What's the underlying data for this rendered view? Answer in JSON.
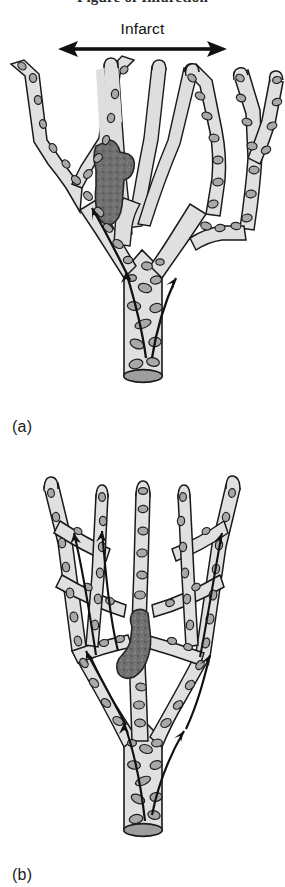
{
  "page": {
    "width": 285,
    "height": 887,
    "background": "#ffffff",
    "header_title": "Figure of Infarction"
  },
  "figure": {
    "caption_a": "(a)",
    "caption_b": "(b)",
    "infarct_label": "Infarct",
    "arrow_name": "infarct-extent-arrow"
  },
  "colors": {
    "vessel_fill": "#e0e0e0",
    "vessel_fill_pale": "#dedede",
    "vessel_outline": "#1a1a1a",
    "cell_fill": "#a8a8a8",
    "cell_outline": "#1f1f1f",
    "thrombus_fill": "#6f6f6f",
    "thrombus_outline": "#262626",
    "lumen_cut_fill": "#9e9e9e",
    "arrow_color": "#111111",
    "text": "#1a1a1a",
    "background": "#ffffff"
  },
  "panel_a": {
    "name": "end-arterial-circulation",
    "description_labels": {
      "infarct_zone": "Infarct",
      "thrombus": "thrombus",
      "trunk": "artery-trunk",
      "cut_end": "vessel-cut-end"
    },
    "flow_arrows": 3,
    "branch_count": 8,
    "occluded_branches": 4
  },
  "panel_b": {
    "name": "anastomosing-circulation",
    "description_labels": {
      "thrombus": "thrombus",
      "trunk": "artery-trunk",
      "cut_end": "vessel-cut-end"
    },
    "flow_arrows": 7,
    "branch_count": 10,
    "anastomoses": 6
  }
}
